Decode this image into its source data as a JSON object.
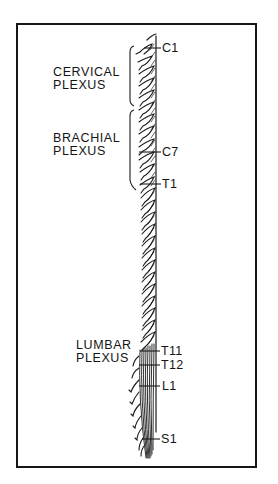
{
  "diagram": {
    "type": "anatomical illustration",
    "colors": {
      "ink": "#141414",
      "background": "#ffffff",
      "frame": "#161616"
    },
    "plexuses": [
      {
        "id": "cervical",
        "line1": "CERVICAL",
        "line2": "PLEXUS"
      },
      {
        "id": "brachial",
        "line1": "BRACHIAL",
        "line2": "PLEXUS"
      },
      {
        "id": "lumbar",
        "line1": "LUMBAR",
        "line2": "PLEXUS"
      }
    ],
    "segments": [
      {
        "id": "c1",
        "label": "C1"
      },
      {
        "id": "c7",
        "label": "C7"
      },
      {
        "id": "t1",
        "label": "T1"
      },
      {
        "id": "t11",
        "label": "T11"
      },
      {
        "id": "t12",
        "label": "T12"
      },
      {
        "id": "l1",
        "label": "L1"
      },
      {
        "id": "s1",
        "label": "S1"
      }
    ]
  }
}
